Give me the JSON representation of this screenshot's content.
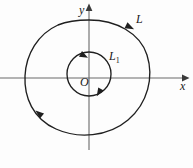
{
  "figure": {
    "background_color": "#fdfdfd",
    "stroke_color": "#1a1a1a",
    "axis_color": "#555555",
    "width": 193,
    "height": 168
  },
  "axes": {
    "x_label": "x",
    "y_label": "y",
    "origin_label": "O",
    "x_axis_y": 78,
    "y_axis_x": 89,
    "x_axis_from": 0,
    "x_axis_to": 186,
    "y_axis_from": 6,
    "y_axis_to": 150
  },
  "curves": [
    {
      "name": "outer-curve",
      "label": "L",
      "label_x": 136,
      "label_y": 18,
      "description": "large egg-shaped closed curve, counterclockwise orientation",
      "arrow_positions": [
        "top-right",
        "lower-left"
      ]
    },
    {
      "name": "inner-curve",
      "label": "L1",
      "label_text": "L",
      "label_subscript": "1",
      "label_x": 109,
      "label_y": 54,
      "description": "small circle about the origin, clockwise orientation",
      "arrow_positions": [
        "top-left",
        "bottom-right"
      ]
    }
  ]
}
